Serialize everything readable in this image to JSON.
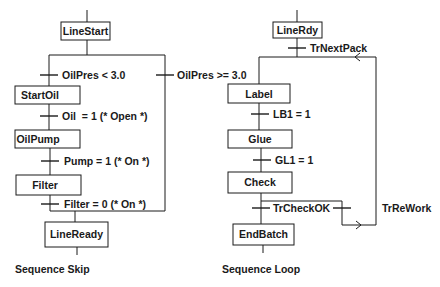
{
  "sequence_skip": {
    "caption": "Sequence Skip",
    "steps": {
      "line_start": "LineStart",
      "start_oil": "StartOil",
      "oil_pump": "OilPump",
      "filter": "Filter",
      "line_ready": "LineReady"
    },
    "transitions": {
      "oil_pres_low": "OilPres < 3.0",
      "oil_pres_high": "OilPres >= 3.0",
      "oil_open": "Oil  = 1 (* Open *)",
      "pump_on": "Pump = 1 (* On *)",
      "filter_on": "Filter = 0 (* On *)"
    }
  },
  "sequence_loop": {
    "caption": "Sequence Loop",
    "steps": {
      "line_rdy": "LineRdy",
      "label": "Label",
      "glue": "Glue",
      "check": "Check",
      "end_batch": "EndBatch"
    },
    "transitions": {
      "next_pack": "TrNextPack",
      "lb1": "LB1 = 1",
      "gl1": "GL1 = 1",
      "check_ok": "TrCheckOK",
      "rework": "TrReWork"
    }
  }
}
